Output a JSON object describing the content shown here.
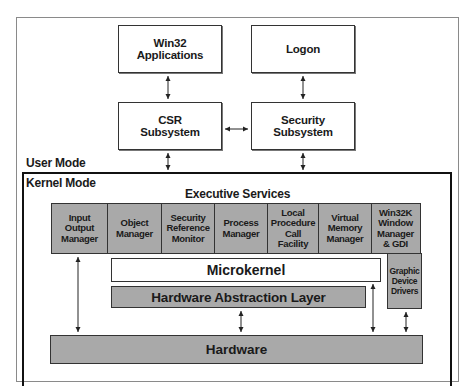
{
  "diagram": {
    "user_mode": {
      "label": "User Mode",
      "boxes": {
        "win32_apps": "Win32\nApplications",
        "logon": "Logon",
        "csr": "CSR\nSubsystem",
        "security": "Security\nSubsystem"
      }
    },
    "kernel_mode": {
      "label": "Kernel Mode",
      "executive_services": {
        "title": "Executive Services",
        "components": [
          "Input\nOutput\nManager",
          "Object\nManager",
          "Security\nReference\nMonitor",
          "Process\nManager",
          "Local\nProcedure\nCall\nFacility",
          "Virtual\nMemory\nManager",
          "Win32K\nWindow\nManager\n& GDI"
        ]
      },
      "microkernel": "Microkernel",
      "hal": "Hardware Abstraction Layer",
      "graphic_device_drivers": "Graphic\nDevice\nDrivers",
      "hardware": "Hardware"
    },
    "colors": {
      "gray_fill": "#a9a9a9",
      "border": "#333333",
      "kernel_border": "#111111",
      "background": "#ffffff"
    }
  }
}
